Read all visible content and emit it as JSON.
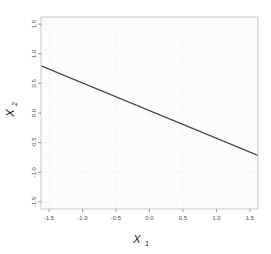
{
  "figure": {
    "background_color": "#ffffff",
    "panel_background_color": "#fcfcfc",
    "panel_border_color": "#c8c8c8",
    "grid_color": "#e8eef2",
    "line_color": "#404040",
    "tick_color": "#7f7f7f",
    "label_color": "#4d4d4d"
  },
  "chart_data": {
    "type": "line",
    "title": "",
    "subtitle": "",
    "xlabel": "X",
    "xlabel_sub": "1",
    "ylabel": "X",
    "ylabel_sub": "2",
    "xlim": [
      -1.62,
      1.62
    ],
    "ylim": [
      -1.62,
      1.62
    ],
    "xticks": [
      -1.5,
      -1.0,
      -0.5,
      0.0,
      0.5,
      1.0,
      1.5
    ],
    "xticklabels": [
      "-1.5",
      "-1.0",
      "-0.5",
      "0.0",
      "0.5",
      "1.0",
      "1.5"
    ],
    "yticks": [
      -1.5,
      -1.0,
      -0.5,
      0.0,
      0.5,
      1.0,
      1.5
    ],
    "yticklabels": [
      "-1.5",
      "-1.0",
      "-0.5",
      "0.0",
      "0.5",
      "1.0",
      "1.5"
    ],
    "grid": true,
    "grid_style": "dotted",
    "legend": false,
    "legend_position": "none",
    "series": [
      {
        "name": "boundary",
        "type": "line",
        "slope": -0.4667,
        "intercept": 0.04,
        "x": [
          -1.62,
          1.62
        ],
        "y": [
          0.796,
          -0.716
        ],
        "color": "#404040",
        "width": 1.2
      }
    ],
    "annotations": []
  }
}
